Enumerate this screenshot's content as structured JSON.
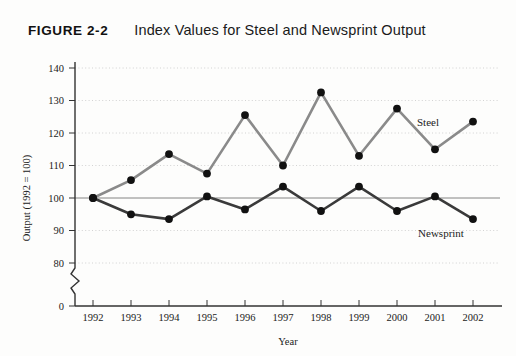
{
  "figure": {
    "number": "FIGURE 2-2",
    "title": "Index Values for Steel and Newsprint Output"
  },
  "chart_data": {
    "type": "line",
    "title": "Index Values for Steel and Newsprint Output",
    "xlabel": "Year",
    "ylabel": "Output (1992 = 100)",
    "categories": [
      "1992",
      "1993",
      "1994",
      "1995",
      "1996",
      "1997",
      "1998",
      "1999",
      "2000",
      "2001",
      "2002"
    ],
    "x": [
      1992,
      1993,
      1994,
      1995,
      1996,
      1997,
      1998,
      1999,
      2000,
      2001,
      2002
    ],
    "series": [
      {
        "name": "Steel",
        "color": "#8a8a8a",
        "values": [
          100,
          105.5,
          113.5,
          107.5,
          125.5,
          110,
          132.5,
          113,
          127.5,
          115,
          123.5
        ]
      },
      {
        "name": "Newsprint",
        "color": "#3a3a3a",
        "values": [
          100,
          95,
          93.5,
          100.5,
          96.5,
          103.5,
          96,
          103.5,
          96,
          100.5,
          93.5
        ]
      }
    ],
    "ylim": [
      80,
      140
    ],
    "yticks": [
      "0",
      "80",
      "90",
      "100",
      "110",
      "120",
      "130",
      "140"
    ],
    "ytick_values": [
      0,
      80,
      90,
      100,
      110,
      120,
      130,
      140
    ],
    "xticks": [
      "1992",
      "1993",
      "1994",
      "1995",
      "1996",
      "1997",
      "1998",
      "1999",
      "2000",
      "2001",
      "2002"
    ],
    "grid": true,
    "grid_axis": "y",
    "axis_break": true,
    "axis_break_between": [
      0,
      80
    ],
    "reference_line": 100,
    "legend_position": "inline-annotations",
    "annotations": [
      {
        "text": "Steel",
        "year": 2001,
        "value": 122
      },
      {
        "text": "Newsprint",
        "year": 2001,
        "value": 91
      }
    ],
    "markers": "filled-circle"
  }
}
